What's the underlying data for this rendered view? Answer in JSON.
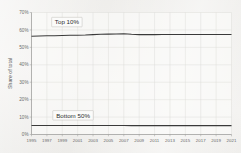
{
  "chart_data": {
    "type": "line",
    "title": "",
    "subtitle": "",
    "xlabel": "",
    "ylabel": "Share of total",
    "xlim": [
      1995,
      2021
    ],
    "ylim": [
      0,
      70
    ],
    "grid": true,
    "legend_position": "inline-annotation",
    "y_tick_labels": [
      "0%",
      "10%",
      "20%",
      "30%",
      "40%",
      "50%",
      "60%",
      "70%"
    ],
    "y_tick_values": [
      0,
      10,
      20,
      30,
      40,
      50,
      60,
      70
    ],
    "x_tick_labels": [
      "1995",
      "1997",
      "1999",
      "2001",
      "2003",
      "2005",
      "2007",
      "2009",
      "2011",
      "2013",
      "2015",
      "2017",
      "2019",
      "2021"
    ],
    "x_tick_values": [
      1995,
      1997,
      1999,
      2001,
      2003,
      2005,
      2007,
      2009,
      2011,
      2013,
      2015,
      2017,
      2019,
      2021
    ],
    "x": [
      1995,
      1996,
      1997,
      1998,
      1999,
      2000,
      2001,
      2002,
      2003,
      2004,
      2005,
      2006,
      2007,
      2008,
      2009,
      2010,
      2011,
      2012,
      2013,
      2014,
      2015,
      2016,
      2017,
      2018,
      2019,
      2020,
      2021
    ],
    "series": [
      {
        "name": "Top 10%",
        "color": "#3a3a3a",
        "values": [
          56.4,
          56.5,
          56.6,
          56.7,
          56.8,
          56.9,
          57.0,
          57.1,
          57.3,
          57.5,
          57.6,
          57.7,
          57.8,
          57.5,
          57.3,
          57.3,
          57.3,
          57.4,
          57.4,
          57.4,
          57.4,
          57.4,
          57.4,
          57.4,
          57.4,
          57.4,
          57.4
        ]
      },
      {
        "name": "Bottom 50%",
        "color": "#3a3a3a",
        "values": [
          5.2,
          5.2,
          5.2,
          5.2,
          5.2,
          5.2,
          5.2,
          5.2,
          5.2,
          5.2,
          5.2,
          5.2,
          5.2,
          5.1,
          5.1,
          5.1,
          5.1,
          5.1,
          5.1,
          5.1,
          5.1,
          5.1,
          5.1,
          5.1,
          5.1,
          5.1,
          5.1
        ]
      }
    ],
    "annotations": [
      {
        "text": "Top 10%",
        "x": 1999.6,
        "y": 64.5
      },
      {
        "text": "Bottom 50%",
        "x": 2000.4,
        "y": 11.0
      }
    ]
  },
  "colors": {
    "background": "#f2f1ef",
    "plot_background": "#fbfbfa",
    "grid": "#dcdbd7",
    "axis": "#9a9a98",
    "line": "#3a3a3a",
    "tick_text": "#6a6a6a",
    "label_text": "#5a5a5a"
  }
}
